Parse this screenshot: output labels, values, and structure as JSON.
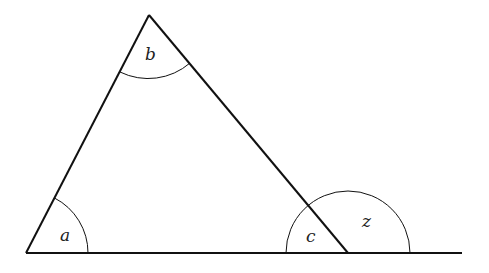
{
  "diagram": {
    "type": "triangle-exterior-angle",
    "vertices": {
      "A": [
        26,
        253
      ],
      "B": [
        149,
        15
      ],
      "C": [
        348,
        253
      ]
    },
    "baseline_end": [
      462,
      253
    ],
    "angles": [
      {
        "name": "a",
        "label": "a",
        "vertex": "A",
        "label_pos": [
          66,
          240
        ]
      },
      {
        "name": "b",
        "label": "b",
        "vertex": "B",
        "label_pos": [
          151,
          60
        ]
      },
      {
        "name": "c",
        "label": "c",
        "vertex": "C",
        "label_pos": [
          311,
          242
        ]
      },
      {
        "name": "z",
        "label": "z",
        "vertex": "C",
        "label_pos": [
          367,
          226
        ]
      }
    ],
    "colors": {
      "stroke": "#111111",
      "text": "#222222"
    }
  }
}
